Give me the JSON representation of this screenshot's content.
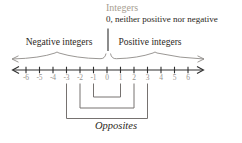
{
  "title": "Integers",
  "annotations": {
    "zero_note": "0, neither positive nor negative",
    "negative_label": "Negative integers",
    "positive_label": "Positive integers",
    "opposites_label": "Opposites"
  },
  "number_line": {
    "min": -6,
    "max": 6,
    "step": 1,
    "values": [
      "-6",
      "-5",
      "-4",
      "-3",
      "-2",
      "-1",
      "0",
      "1",
      "2",
      "3",
      "4",
      "5",
      "6"
    ],
    "opposite_pairs": [
      [
        -1,
        1
      ],
      [
        -2,
        2
      ],
      [
        -3,
        3
      ]
    ]
  },
  "colors": {
    "title": "#a79e92",
    "dark_text": "#2b2722",
    "line": "#2f2f2f",
    "numbers": "#979390",
    "brace": "#8f8b88",
    "bracket": "#767270",
    "background": "#ffffff"
  }
}
